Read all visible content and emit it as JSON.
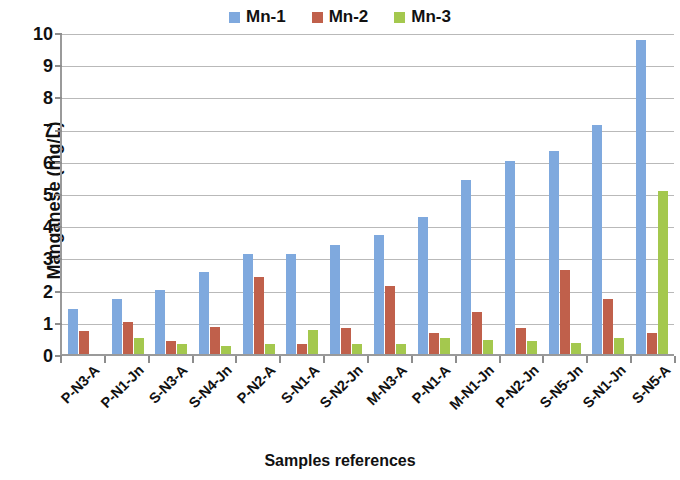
{
  "chart_data": {
    "type": "bar",
    "title": "",
    "xlabel": "Samples references",
    "ylabel": "Manganese  (mg/L)",
    "ylim": [
      0,
      10
    ],
    "yticks": [
      0,
      1,
      2,
      3,
      4,
      5,
      6,
      7,
      8,
      9,
      10
    ],
    "grid": true,
    "legend_position": "top-center",
    "categories": [
      "P-N3-A",
      "P-N1-Jn",
      "S-N3-A",
      "S-N4-Jn",
      "P-N2-A",
      "S-N1-A",
      "S-N2-Jn",
      "M-N3-A",
      "P-N1-A",
      "M-N1-Jn",
      "P-N2-Jn",
      "S-N5-Jn",
      "S-N1-Jn",
      "S-N5-A"
    ],
    "series": [
      {
        "name": "Mn-1",
        "color": "#7FA9DE",
        "values": [
          1.4,
          1.7,
          2.0,
          2.55,
          3.1,
          3.1,
          3.4,
          3.7,
          4.25,
          5.4,
          6.0,
          6.3,
          7.1,
          9.75
        ]
      },
      {
        "name": "Mn-2",
        "color": "#C0604B",
        "values": [
          0.7,
          1.0,
          0.4,
          0.85,
          2.4,
          0.3,
          0.8,
          2.1,
          0.65,
          1.3,
          0.8,
          2.6,
          1.7,
          0.65
        ]
      },
      {
        "name": "Mn-3",
        "color": "#A4C84E",
        "values": [
          0,
          0.5,
          0.3,
          0.25,
          0.3,
          0.75,
          0.3,
          0.3,
          0.5,
          0.45,
          0.4,
          0.35,
          0.5,
          5.05
        ]
      }
    ]
  }
}
